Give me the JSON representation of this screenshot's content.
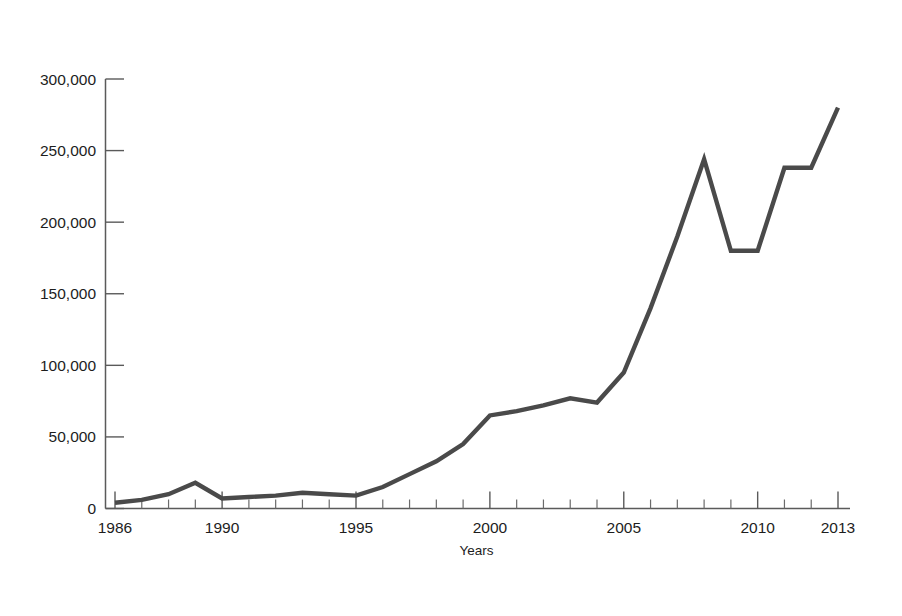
{
  "figure": {
    "background_color": "#ffffff",
    "frame_color": "#3f3f3f",
    "line_color": "#4a4a4a"
  },
  "chart_data": {
    "type": "line",
    "title": "",
    "subtitle": "",
    "xlabel": "Years",
    "ylabel": "",
    "grid": false,
    "legend": null,
    "xlim": [
      1986,
      2013
    ],
    "ylim": [
      0,
      300000
    ],
    "x_tick_labels": [
      "1986",
      "1990",
      "1995",
      "2000",
      "2005",
      "2010",
      "2013"
    ],
    "x_tick_values": [
      1986,
      1990,
      1995,
      2000,
      2005,
      2010,
      2013
    ],
    "x_minor_ticks_every": 1,
    "y_tick_labels": [
      "0",
      "50,000",
      "100,000",
      "150,000",
      "200,000",
      "250,000",
      "300,000"
    ],
    "y_tick_values": [
      0,
      50000,
      100000,
      150000,
      200000,
      250000,
      300000
    ],
    "x": [
      1986,
      1987,
      1988,
      1989,
      1990,
      1991,
      1992,
      1993,
      1994,
      1995,
      1996,
      1997,
      1998,
      1999,
      2000,
      2001,
      2002,
      2003,
      2004,
      2005,
      2006,
      2007,
      2008,
      2009,
      2010,
      2011,
      2012,
      2013
    ],
    "values": [
      4000,
      6000,
      10000,
      18000,
      7000,
      8000,
      9000,
      11000,
      10000,
      9000,
      15000,
      24000,
      33000,
      45000,
      65000,
      68000,
      72000,
      77000,
      74000,
      95000,
      140000,
      190000,
      244000,
      180000,
      180000,
      238000,
      238000,
      280000
    ],
    "series": [
      {
        "name": "",
        "values": [
          4000,
          6000,
          10000,
          18000,
          7000,
          8000,
          9000,
          11000,
          10000,
          9000,
          15000,
          24000,
          33000,
          45000,
          65000,
          68000,
          72000,
          77000,
          74000,
          95000,
          140000,
          190000,
          244000,
          180000,
          180000,
          238000,
          238000,
          280000
        ]
      }
    ]
  }
}
